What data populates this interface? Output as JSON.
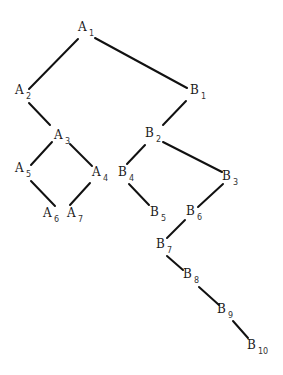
{
  "diagram": {
    "type": "tree",
    "nodes": [
      {
        "id": "A1",
        "letter": "A",
        "sub": "1",
        "x": 83,
        "y": 31
      },
      {
        "id": "A2",
        "letter": "A",
        "sub": "2",
        "x": 20,
        "y": 94
      },
      {
        "id": "A3",
        "letter": "A",
        "sub": "3",
        "x": 59,
        "y": 139
      },
      {
        "id": "A4",
        "letter": "A",
        "sub": "4",
        "x": 97,
        "y": 176
      },
      {
        "id": "A5",
        "letter": "A",
        "sub": "5",
        "x": 20,
        "y": 172
      },
      {
        "id": "A6",
        "letter": "A",
        "sub": "6",
        "x": 48,
        "y": 217
      },
      {
        "id": "A7",
        "letter": "A",
        "sub": "7",
        "x": 72,
        "y": 217
      },
      {
        "id": "B1",
        "letter": "B",
        "sub": "1",
        "x": 195,
        "y": 94
      },
      {
        "id": "B2",
        "letter": "B",
        "sub": "2",
        "x": 150,
        "y": 137
      },
      {
        "id": "B3",
        "letter": "B",
        "sub": "3",
        "x": 227,
        "y": 180
      },
      {
        "id": "B4",
        "letter": "B",
        "sub": "4",
        "x": 123,
        "y": 176
      },
      {
        "id": "B5",
        "letter": "B",
        "sub": "5",
        "x": 155,
        "y": 216
      },
      {
        "id": "B6",
        "letter": "B",
        "sub": "6",
        "x": 191,
        "y": 215
      },
      {
        "id": "B7",
        "letter": "B",
        "sub": "7",
        "x": 161,
        "y": 248
      },
      {
        "id": "B8",
        "letter": "B",
        "sub": "8",
        "x": 188,
        "y": 278
      },
      {
        "id": "B9",
        "letter": "B",
        "sub": "9",
        "x": 222,
        "y": 313
      },
      {
        "id": "B10",
        "letter": "B",
        "sub": "10",
        "x": 252,
        "y": 349
      }
    ],
    "edges": [
      {
        "from": "A1",
        "to": "A2",
        "x1": 78,
        "y1": 39,
        "x2": 29,
        "y2": 89
      },
      {
        "from": "A1",
        "to": "B1",
        "x1": 95,
        "y1": 38,
        "x2": 187,
        "y2": 88
      },
      {
        "from": "A2",
        "to": "A3",
        "x1": 29,
        "y1": 103,
        "x2": 50,
        "y2": 125
      },
      {
        "from": "A3",
        "to": "A5",
        "x1": 52,
        "y1": 142,
        "x2": 31,
        "y2": 165
      },
      {
        "from": "A3",
        "to": "A4",
        "x1": 70,
        "y1": 144,
        "x2": 92,
        "y2": 166
      },
      {
        "from": "A5",
        "to": "A6",
        "x1": 31,
        "y1": 181,
        "x2": 55,
        "y2": 206
      },
      {
        "from": "A4",
        "to": "A7",
        "x1": 90,
        "y1": 183,
        "x2": 70,
        "y2": 205
      },
      {
        "from": "B1",
        "to": "B2",
        "x1": 186,
        "y1": 101,
        "x2": 163,
        "y2": 125
      },
      {
        "from": "B2",
        "to": "B4",
        "x1": 145,
        "y1": 145,
        "x2": 127,
        "y2": 164
      },
      {
        "from": "B2",
        "to": "B3",
        "x1": 163,
        "y1": 142,
        "x2": 222,
        "y2": 172
      },
      {
        "from": "B4",
        "to": "B5",
        "x1": 129,
        "y1": 184,
        "x2": 149,
        "y2": 205
      },
      {
        "from": "B3",
        "to": "B6",
        "x1": 223,
        "y1": 184,
        "x2": 198,
        "y2": 207
      },
      {
        "from": "B6",
        "to": "B7",
        "x1": 185,
        "y1": 220,
        "x2": 167,
        "y2": 238
      },
      {
        "from": "B7",
        "to": "B8",
        "x1": 167,
        "y1": 256,
        "x2": 183,
        "y2": 270
      },
      {
        "from": "B8",
        "to": "B9",
        "x1": 199,
        "y1": 287,
        "x2": 219,
        "y2": 305
      },
      {
        "from": "B9",
        "to": "B10",
        "x1": 233,
        "y1": 321,
        "x2": 248,
        "y2": 338
      }
    ]
  }
}
